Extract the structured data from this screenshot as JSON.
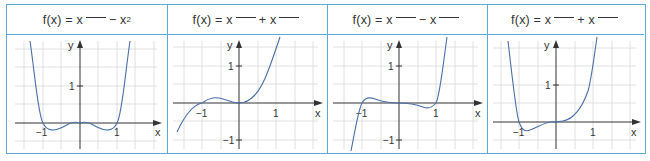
{
  "columns": [
    {
      "header": {
        "prefix": "f(x) = x",
        "op": "−",
        "term2": "x",
        "term2_exp": "2",
        "blank1": true,
        "blank2": false
      },
      "graph": {
        "function": "x^4 - x^2",
        "roots": [
          -1,
          0,
          1
        ]
      }
    },
    {
      "header": {
        "prefix": "f(x) = x",
        "op": "+",
        "term2": "x",
        "term2_exp": "",
        "blank1": true,
        "blank2": true
      },
      "graph": {
        "function": "x^3 + x^2",
        "roots": [
          -1,
          0
        ]
      }
    },
    {
      "header": {
        "prefix": "f(x) = x",
        "op": "−",
        "term2": "x",
        "term2_exp": "",
        "blank1": true,
        "blank2": true
      },
      "graph": {
        "function": "x^5 - x^3",
        "roots": [
          -1,
          0,
          1
        ]
      }
    },
    {
      "header": {
        "prefix": "f(x) = x",
        "op": "+",
        "term2": "x",
        "term2_exp": "",
        "blank1": true,
        "blank2": true
      },
      "graph": {
        "function": "x^4 + x^3",
        "roots": [
          -1,
          0
        ]
      }
    }
  ],
  "axis_labels": {
    "x": "x",
    "y": "y",
    "one": "1",
    "neg_one": "−1"
  },
  "colors": {
    "border": "#5aa9d6",
    "grid": "#d8d8d8",
    "axis": "#333333",
    "curve": "#4a6fa8"
  }
}
